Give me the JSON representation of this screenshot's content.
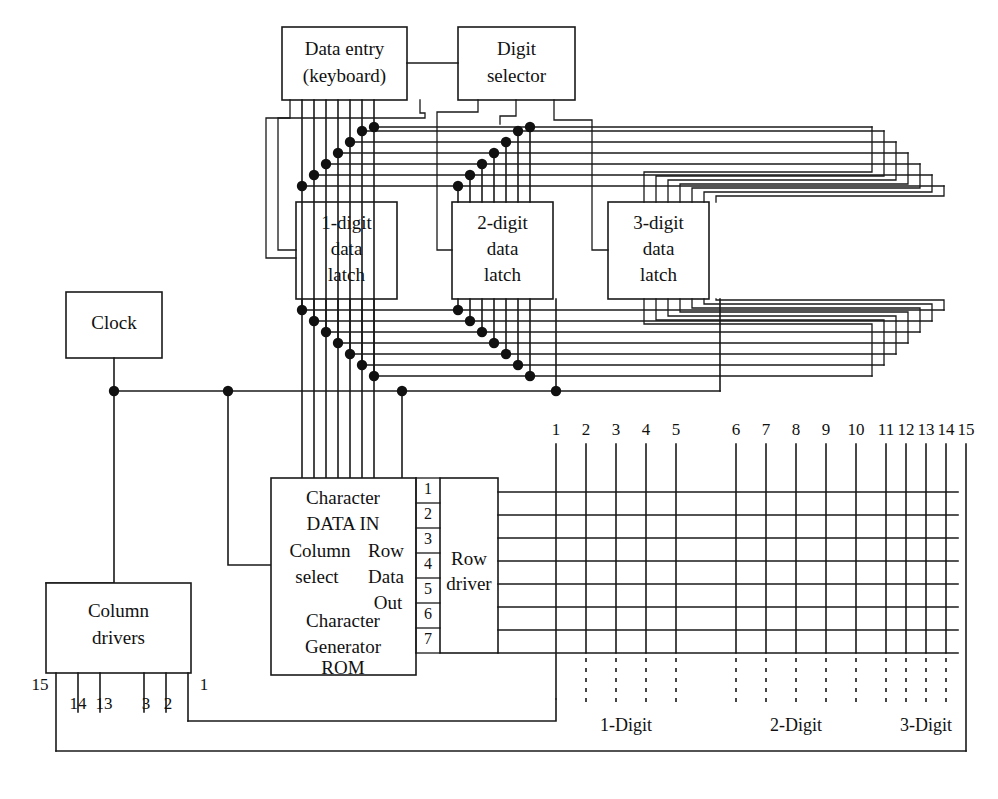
{
  "diagram": {
    "blocks": {
      "data_entry": {
        "line1": "Data entry",
        "line2": "(keyboard)"
      },
      "digit_selector": {
        "line1": "Digit",
        "line2": "selector"
      },
      "latch1": {
        "line1": "1-digit",
        "line2": "data",
        "line3": "latch"
      },
      "latch2": {
        "line1": "2-digit",
        "line2": "data",
        "line3": "latch"
      },
      "latch3": {
        "line1": "3-digit",
        "line2": "data",
        "line3": "latch"
      },
      "clock": {
        "line1": "Clock"
      },
      "column_drivers": {
        "line1": "Column",
        "line2": "drivers"
      },
      "row_driver": {
        "line1": "Row",
        "line2": "driver"
      },
      "rom": {
        "line1": "Character",
        "line2": "DATA  IN",
        "line3a": "Column",
        "line3b": "Row",
        "line4a": "select",
        "line4b": "Data",
        "line5b": "Out",
        "line6": "Character",
        "line7": "Generator",
        "line8": "ROM"
      }
    },
    "rom_output_pins": [
      "1",
      "2",
      "3",
      "4",
      "5",
      "6",
      "7"
    ],
    "column_numbers_top": [
      "1",
      "2",
      "3",
      "4",
      "5",
      "6",
      "7",
      "8",
      "9",
      "10",
      "11",
      "12",
      "13",
      "14",
      "15"
    ],
    "column_driver_pins": [
      "15",
      "14",
      "13",
      "3",
      "2",
      "1"
    ],
    "digit_group_labels": [
      "1-Digit",
      "2-Digit",
      "3-Digit"
    ],
    "colors": {
      "ink": "#1a1a1a",
      "background": "#ffffff",
      "junction": "#111111"
    }
  }
}
